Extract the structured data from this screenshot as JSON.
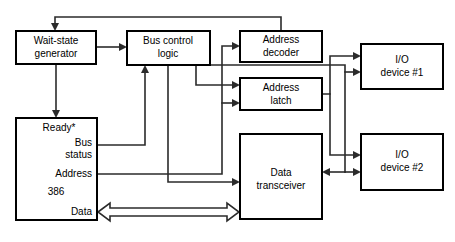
{
  "diagram": {
    "background_color": "#ffffff",
    "line_color": "#2b2b2b",
    "box_border_color": "#000000",
    "box_fill_color": "#ffffff",
    "blocks": [
      {
        "id": "wait_state_generator",
        "line1": "Wait-state",
        "line2": "generator"
      },
      {
        "id": "bus_control_logic",
        "line1": "Bus control",
        "line2": "logic"
      },
      {
        "id": "address_decoder",
        "line1": "Address",
        "line2": "decoder"
      },
      {
        "id": "address_latch",
        "line1": "Address",
        "line2": "latch"
      },
      {
        "id": "io_device_1",
        "line1": "I/O",
        "line2": "device #1"
      },
      {
        "id": "io_device_2",
        "line1": "I/O",
        "line2": "device #2"
      },
      {
        "id": "data_transceiver",
        "line1": "Data",
        "line2": "transceiver"
      },
      {
        "id": "cpu_386",
        "line1": "386",
        "line2": ""
      }
    ],
    "cpu_pins": {
      "ready": "Ready*",
      "bus_status_line1": "Bus",
      "bus_status_line2": "status",
      "address": "Address",
      "chip": "386",
      "data": "Data"
    }
  }
}
